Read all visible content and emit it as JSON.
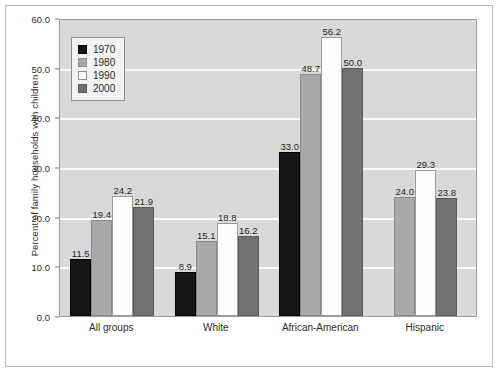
{
  "chart_data": {
    "type": "bar",
    "title": "",
    "xlabel": "",
    "ylabel": "Percent of family households with children",
    "ylim": [
      0.0,
      60.0
    ],
    "ytick_labels": [
      "0.0",
      "10.0",
      "20.0",
      "30.0",
      "40.0",
      "50.0",
      "60.0"
    ],
    "ytick_values": [
      0,
      10,
      20,
      30,
      40,
      50,
      60
    ],
    "grid": true,
    "legend_position": "upper-left-inside",
    "categories": [
      "All groups",
      "White",
      "African-American",
      "Hispanic"
    ],
    "series": [
      {
        "name": "1970",
        "color": "#161616",
        "values": [
          11.5,
          8.9,
          33.0,
          null
        ],
        "labels": [
          "11.5",
          "8.9",
          "33.0",
          ""
        ]
      },
      {
        "name": "1980",
        "color": "#a9a9a9",
        "values": [
          19.4,
          15.1,
          48.7,
          24.0
        ],
        "labels": [
          "19.4",
          "15.1",
          "48.7",
          "24.0"
        ]
      },
      {
        "name": "1990",
        "color": "#fdfdfd",
        "values": [
          24.2,
          18.8,
          56.2,
          29.3
        ],
        "labels": [
          "24.2",
          "18.8",
          "56.2",
          "29.3"
        ]
      },
      {
        "name": "2000",
        "color": "#717171",
        "values": [
          21.9,
          16.2,
          50.0,
          23.8
        ],
        "labels": [
          "21.9",
          "16.2",
          "50.0",
          "23.8"
        ]
      }
    ],
    "plot_background": "#d9d9d9",
    "gridline_color": "#fbfbfb",
    "text_color": "#2b2b2b"
  },
  "legend": {
    "items": [
      {
        "label": "1970"
      },
      {
        "label": "1980"
      },
      {
        "label": "1990"
      },
      {
        "label": "2000"
      }
    ]
  }
}
